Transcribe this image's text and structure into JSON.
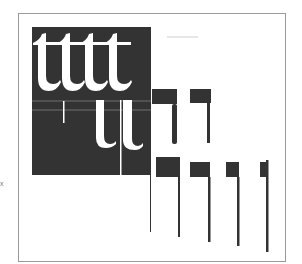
{
  "figure": {
    "side_mark": "x",
    "rows": [
      {
        "name": "row-1",
        "letters": [
          "t",
          "t",
          "t",
          "t"
        ]
      },
      {
        "name": "row-2",
        "letters": [
          "t",
          "t",
          "t",
          "t",
          "t"
        ]
      },
      {
        "name": "row-3",
        "shapes": [
          "flag",
          "flag",
          "flag",
          "flag",
          "flag",
          "flag"
        ]
      }
    ],
    "colors": {
      "ink": "#333333",
      "background": "#ffffff",
      "frame": "#9a9a9a",
      "guide": "#bdbdbd"
    }
  }
}
